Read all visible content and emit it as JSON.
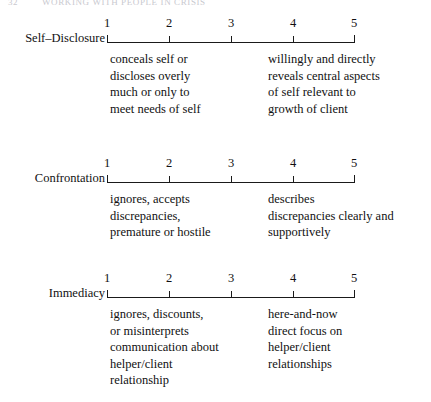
{
  "page_header": {
    "folio": "32",
    "running_title": "WORKING WITH PEOPLE IN CRISIS"
  },
  "scales": [
    {
      "name": "Self–Disclosure",
      "ticks": [
        "1",
        "2",
        "3",
        "4",
        "5"
      ],
      "low_anchor": "conceals self or\ndiscloses overly\nmuch or only to\nmeet needs of self",
      "high_anchor": "willingly and directly\nreveals central aspects\nof self relevant to\ngrowth of client"
    },
    {
      "name": "Confrontation",
      "ticks": [
        "1",
        "2",
        "3",
        "4",
        "5"
      ],
      "low_anchor": "ignores, accepts\ndiscrepancies,\npremature or hostile",
      "high_anchor": "describes\ndiscrepancies clearly and\nsupportively"
    },
    {
      "name": "Immediacy",
      "ticks": [
        "1",
        "2",
        "3",
        "4",
        "5"
      ],
      "low_anchor": "ignores, discounts,\nor misinterprets\ncommunication about\nhelper/client\nrelationship",
      "high_anchor": "here-and-now\ndirect focus on\nhelper/client\nrelationships"
    }
  ],
  "colors": {
    "ink": "#111111",
    "axis": "#1a1a1a",
    "header_faint": "#c9c9cf",
    "background": "#ffffff"
  }
}
